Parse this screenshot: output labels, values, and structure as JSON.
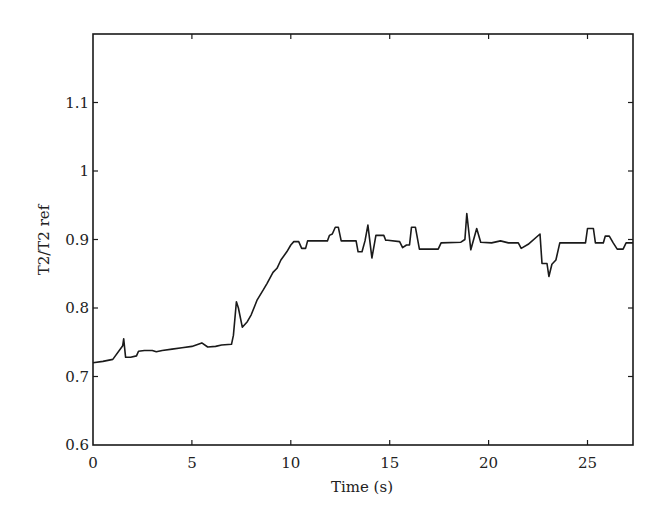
{
  "chart_data": {
    "type": "line",
    "title": "",
    "xlabel": "Time (s)",
    "ylabel": "T2/T2 ref",
    "xlim": [
      0,
      27.3
    ],
    "ylim": [
      0.6,
      1.2
    ],
    "xticks": [
      0,
      5,
      10,
      15,
      20,
      25
    ],
    "xtick_labels": [
      "0",
      "5",
      "10",
      "15",
      "20",
      "25"
    ],
    "yticks": [
      0.6,
      0.7,
      0.8,
      0.9,
      1.0,
      1.1
    ],
    "ytick_labels": [
      "0.6",
      "0.7",
      "0.8",
      "0.9",
      "1",
      "1.1"
    ],
    "grid": false,
    "legend": null,
    "line_color": "#1a1a1a",
    "series": [
      {
        "name": "T2/T2 ref",
        "x": [
          0.0,
          0.5,
          1.0,
          1.5,
          1.55,
          1.65,
          1.9,
          2.2,
          2.3,
          2.6,
          3.0,
          3.2,
          3.5,
          4.0,
          4.5,
          5.0,
          5.5,
          5.8,
          6.2,
          6.5,
          7.0,
          7.1,
          7.25,
          7.35,
          7.55,
          7.8,
          8.0,
          8.3,
          8.6,
          8.8,
          9.1,
          9.3,
          9.5,
          9.8,
          10.0,
          10.15,
          10.4,
          10.55,
          10.75,
          10.85,
          11.85,
          11.95,
          12.1,
          12.25,
          12.4,
          12.55,
          13.3,
          13.4,
          13.6,
          13.75,
          13.9,
          14.1,
          14.3,
          14.7,
          14.8,
          14.9,
          15.5,
          15.65,
          15.85,
          16.0,
          16.1,
          16.3,
          16.5,
          17.45,
          17.6,
          18.6,
          18.8,
          18.9,
          19.1,
          19.4,
          19.6,
          20.15,
          20.6,
          21.0,
          21.5,
          21.65,
          22.0,
          22.6,
          22.7,
          22.95,
          23.05,
          23.2,
          23.4,
          23.6,
          24.9,
          25.0,
          25.3,
          25.4,
          25.8,
          25.9,
          26.1,
          26.3,
          26.5,
          26.8,
          26.95,
          27.3
        ],
        "y": [
          0.72,
          0.722,
          0.725,
          0.745,
          0.755,
          0.728,
          0.728,
          0.73,
          0.737,
          0.738,
          0.738,
          0.736,
          0.738,
          0.74,
          0.742,
          0.744,
          0.749,
          0.743,
          0.744,
          0.746,
          0.747,
          0.76,
          0.809,
          0.8,
          0.772,
          0.78,
          0.79,
          0.812,
          0.826,
          0.836,
          0.852,
          0.858,
          0.87,
          0.882,
          0.892,
          0.897,
          0.897,
          0.887,
          0.887,
          0.898,
          0.898,
          0.906,
          0.908,
          0.918,
          0.918,
          0.898,
          0.898,
          0.882,
          0.882,
          0.898,
          0.921,
          0.873,
          0.906,
          0.906,
          0.899,
          0.899,
          0.897,
          0.888,
          0.892,
          0.892,
          0.918,
          0.918,
          0.886,
          0.886,
          0.895,
          0.896,
          0.9,
          0.938,
          0.885,
          0.916,
          0.896,
          0.895,
          0.898,
          0.895,
          0.895,
          0.887,
          0.893,
          0.908,
          0.865,
          0.865,
          0.846,
          0.864,
          0.87,
          0.895,
          0.895,
          0.916,
          0.916,
          0.895,
          0.895,
          0.905,
          0.905,
          0.895,
          0.886,
          0.886,
          0.895,
          0.895
        ]
      }
    ]
  }
}
